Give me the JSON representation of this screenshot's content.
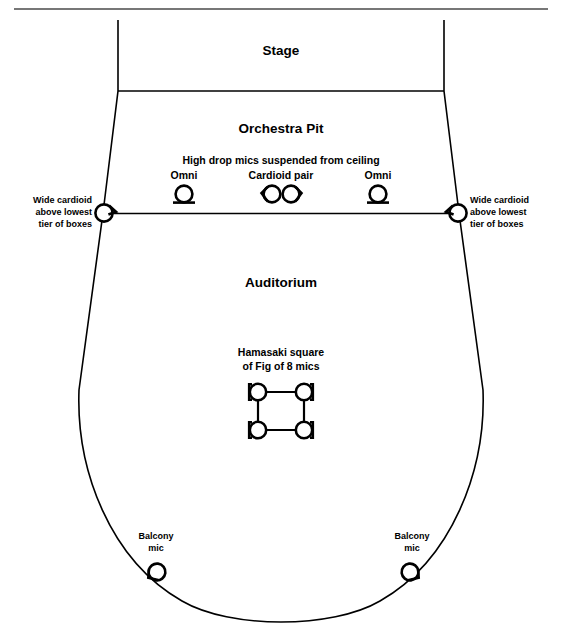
{
  "diagram": {
    "sections": {
      "stage": "Stage",
      "orchestra_pit": "Orchestra Pit",
      "auditorium": "Auditorium"
    },
    "annotations": {
      "high_drop": "High drop mics suspended from ceiling",
      "omni_left": "Omni",
      "cardioid_pair": "Cardioid pair",
      "omni_right": "Omni",
      "wide_cardioid_left_line1": "Wide cardioid",
      "wide_cardioid_left_line2": "above lowest",
      "wide_cardioid_left_line3": "tier of boxes",
      "wide_cardioid_right_line1": "Wide cardioid",
      "wide_cardioid_right_line2": "above lowest",
      "wide_cardioid_right_line3": "tier of boxes",
      "hamasaki_line1": "Hamasaki square",
      "hamasaki_line2": "of Fig of 8 mics",
      "balcony_left_line1": "Balcony",
      "balcony_left_line2": "mic",
      "balcony_right_line1": "Balcony",
      "balcony_right_line2": "mic"
    },
    "mic_symbols": {
      "omni": "omni-mic-icon",
      "cardioid": "cardioid-mic-icon",
      "wide_cardioid": "wide-cardioid-mic-icon",
      "figure8": "figure-8-mic-icon",
      "balcony": "cardioid-mic-icon"
    },
    "colors": {
      "ink": "#000000",
      "paper": "#ffffff",
      "rule": "#4a4a4a"
    }
  }
}
